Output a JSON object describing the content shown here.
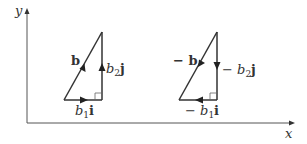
{
  "axes": {
    "x_label": "x",
    "y_label": "y"
  },
  "left_triangle": {
    "hypotenuse_label": "b",
    "horizontal_label_coef": "b",
    "horizontal_label_sub": "1",
    "horizontal_label_unit": "i",
    "vertical_label_coef": "b",
    "vertical_label_sub": "2",
    "vertical_label_unit": "j"
  },
  "right_triangle": {
    "hypotenuse_label": "− b",
    "horizontal_label_sign": "−",
    "horizontal_label_coef": "b",
    "horizontal_label_sub": "1",
    "horizontal_label_unit": "i",
    "vertical_label_sign": "−",
    "vertical_label_coef": "b",
    "vertical_label_sub": "2",
    "vertical_label_unit": "j"
  },
  "colors": {
    "stroke": "#333333",
    "axis": "#555555"
  }
}
